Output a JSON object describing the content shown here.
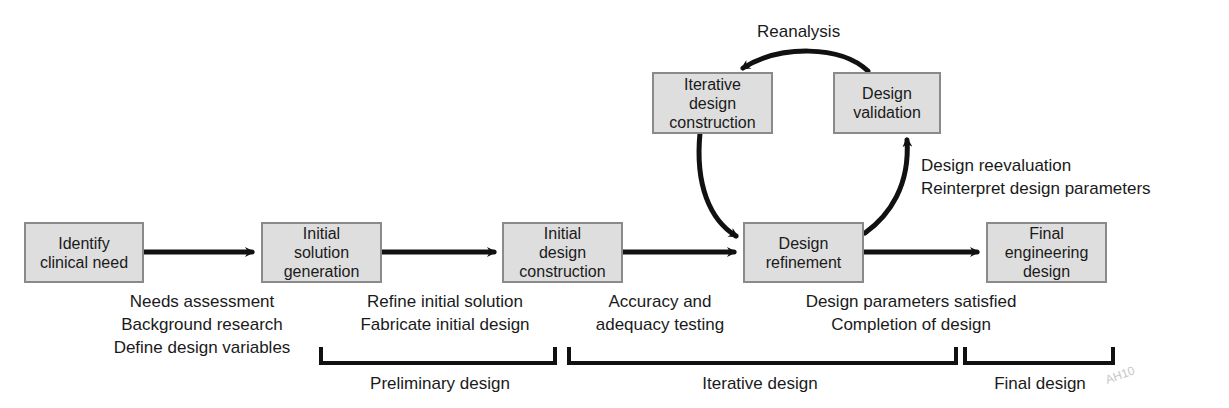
{
  "diagram": {
    "nodes": [
      {
        "id": "identify",
        "lines": [
          "Identify",
          "clinical need"
        ]
      },
      {
        "id": "initial_solution",
        "lines": [
          "Initial",
          "solution",
          "generation"
        ]
      },
      {
        "id": "initial_design",
        "lines": [
          "Initial",
          "design",
          "construction"
        ]
      },
      {
        "id": "refinement",
        "lines": [
          "Design",
          "refinement"
        ]
      },
      {
        "id": "final",
        "lines": [
          "Final",
          "engineering",
          "design"
        ]
      },
      {
        "id": "iterative_construction",
        "lines": [
          "Iterative",
          "design",
          "construction"
        ]
      },
      {
        "id": "validation",
        "lines": [
          "Design",
          "validation"
        ]
      }
    ],
    "edge_labels": {
      "step1": [
        "Needs assessment",
        "Background research",
        "Define design variables"
      ],
      "step2": [
        "Refine initial solution",
        "Fabricate initial design"
      ],
      "step3": [
        "Accuracy and",
        "adequacy testing"
      ],
      "step4": [
        "Design parameters satisfied",
        "Completion of design"
      ],
      "reevaluation": [
        "Design reevaluation",
        "Reinterpret design parameters"
      ],
      "reanalysis": "Reanalysis"
    },
    "phases": [
      {
        "label": "Preliminary design"
      },
      {
        "label": "Iterative design"
      },
      {
        "label": "Final design"
      }
    ],
    "watermark": "AH10"
  }
}
